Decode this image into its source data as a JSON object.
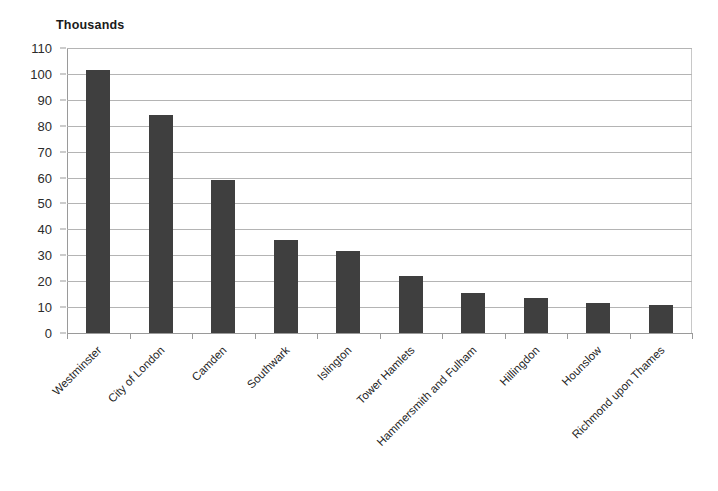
{
  "chart_data": {
    "type": "bar",
    "title": "Thousands",
    "xlabel": "",
    "ylabel": "",
    "ylim": [
      0,
      110
    ],
    "ytick_step": 10,
    "grid": true,
    "legend": false,
    "orientation": "vertical",
    "bar_color": "#3f3f3f",
    "gridline_color": "#b4b4b4",
    "axis_color": "#9a9a9a",
    "label_rotation_degrees": -45,
    "categories": [
      "Westminster",
      "City of London",
      "Camden",
      "Southwark",
      "Islington",
      "Tower Hamlets",
      "Hammersmith and Fulham",
      "Hillingdon",
      "Hounslow",
      "Richmond upon Thames"
    ],
    "values": [
      101.5,
      84,
      59,
      36,
      31.8,
      22,
      15.5,
      13.7,
      11.5,
      11
    ],
    "ytick_labels": [
      "110",
      "100",
      "90",
      "80",
      "70",
      "60",
      "50",
      "40",
      "30",
      "20",
      "10",
      "0"
    ],
    "ytick_values": [
      110,
      100,
      90,
      80,
      70,
      60,
      50,
      40,
      30,
      20,
      10,
      0
    ]
  }
}
